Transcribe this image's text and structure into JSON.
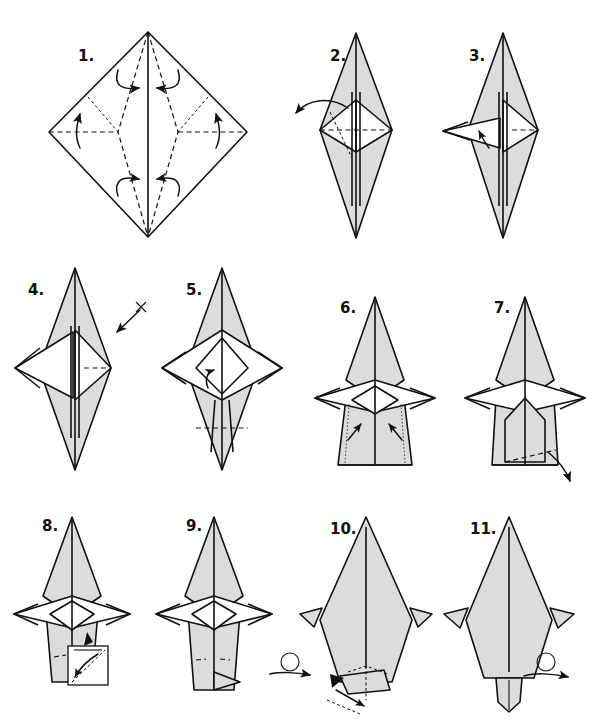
{
  "document": {
    "title": "Origami folding diagram",
    "subject": "bird / crane style model",
    "background_color": "#ffffff",
    "ink_color": "#111111",
    "paper_shaded_color": "#dcdcdc",
    "paper_white_color": "#ffffff",
    "step_count": 11,
    "canvas": {
      "width": 595,
      "height": 720
    }
  },
  "legend": {
    "valley_fold": "dashed line",
    "hidden_edge": "fine dashed line",
    "fold_arrow": "curved arrow",
    "turn_over": "looped arrow symbol",
    "push_here": "solid black arrowhead",
    "repeat_marker": "x"
  },
  "steps": [
    {
      "id": 1,
      "label": "1.",
      "row": 1,
      "column": 1,
      "shape": "kite-base diamond",
      "fill": "white",
      "annotations": [
        "four curved arrows",
        "dashed diagonal valley folds",
        "horizontal dashed folds"
      ]
    },
    {
      "id": 2,
      "label": "2.",
      "row": 1,
      "column": 2,
      "shape": "narrow diamond with side flaps",
      "fill": "shaded",
      "annotations": [
        "curved arrow to the left",
        "hidden fold dashed line"
      ]
    },
    {
      "id": 3,
      "label": "3.",
      "row": 1,
      "column": 3,
      "shape": "narrow diamond with left point pulled out",
      "fill": "shaded",
      "annotations": [
        "small inward arrow"
      ]
    },
    {
      "id": 4,
      "label": "4.",
      "row": 2,
      "column": 1,
      "shape": "diamond with left wing extended",
      "fill": "shaded",
      "annotations": [
        "repeat arrow marked x"
      ]
    },
    {
      "id": 5,
      "label": "5.",
      "row": 2,
      "column": 2,
      "shape": "four-point star with both wings out",
      "fill": "shaded",
      "annotations": [
        "small curved arrow",
        "horizontal dashed valley fold"
      ]
    },
    {
      "id": 6,
      "label": "6.",
      "row": 2,
      "column": 3,
      "shape": "star with bottom folded up flat",
      "fill": "shaded",
      "annotations": [
        "two dotted guide lines",
        "two inward arrows"
      ]
    },
    {
      "id": 7,
      "label": "7.",
      "row": 2,
      "column": 4,
      "shape": "star with narrowed base",
      "fill": "shaded",
      "annotations": [
        "dashed hidden fold",
        "arrow pointing down-right"
      ]
    },
    {
      "id": 8,
      "label": "8.",
      "row": 3,
      "column": 1,
      "shape": "star with tapered base",
      "fill": "shaded",
      "annotations": [
        "detail inset box",
        "black push arrowhead",
        "crossed fold arrow"
      ]
    },
    {
      "id": 9,
      "label": "9.",
      "row": 3,
      "column": 2,
      "shape": "star with pointed base",
      "fill": "shaded",
      "annotations": [
        "turn over symbol"
      ]
    },
    {
      "id": 10,
      "label": "10.",
      "row": 3,
      "column": 3,
      "shape": "body with small side wings",
      "fill": "shaded",
      "annotations": [
        "black push arrowhead",
        "dashed fold lines",
        "arrow pointing down"
      ]
    },
    {
      "id": 11,
      "label": "11.",
      "row": 3,
      "column": 4,
      "shape": "finished body with tail flap",
      "fill": "shaded",
      "annotations": [
        "turn over symbol"
      ]
    }
  ]
}
